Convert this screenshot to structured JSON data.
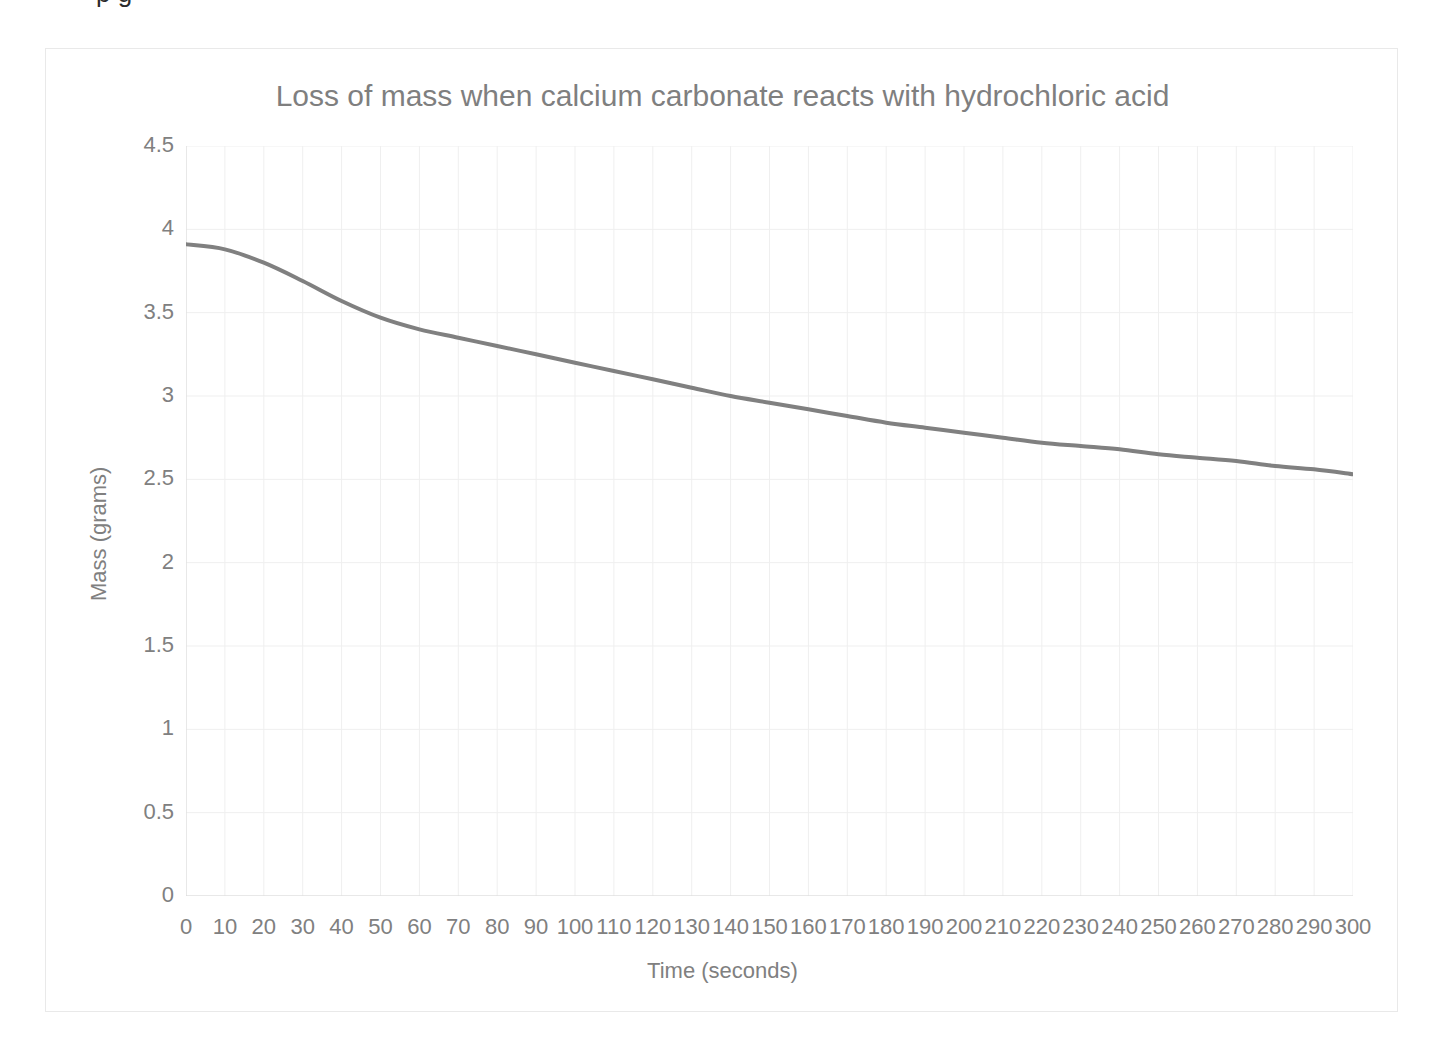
{
  "top_clipped_text": "p    g",
  "chart_frame": {
    "border_color": "#e9e9e9",
    "background": "#ffffff"
  },
  "chart_data": {
    "type": "line",
    "title": "Loss of mass when calcium carbonate reacts with hydrochloric acid",
    "xlabel": "Time (seconds)",
    "ylabel": "Mass (grams)",
    "xlim": [
      0,
      300
    ],
    "ylim": [
      0,
      4.5
    ],
    "grid": true,
    "legend": "none",
    "line_color": "#808080",
    "line_width": 4,
    "x_tick_labels": [
      "0",
      "10",
      "20",
      "30",
      "40",
      "50",
      "60",
      "70",
      "80",
      "90",
      "100",
      "110",
      "120",
      "130",
      "140",
      "150",
      "160",
      "170",
      "180",
      "190",
      "200",
      "210",
      "220",
      "230",
      "240",
      "250",
      "260",
      "270",
      "280",
      "290",
      "300"
    ],
    "y_tick_labels": [
      "0",
      "0.5",
      "1",
      "1.5",
      "2",
      "2.5",
      "3",
      "3.5",
      "4",
      "4.5"
    ],
    "x_tick_values": [
      0,
      10,
      20,
      30,
      40,
      50,
      60,
      70,
      80,
      90,
      100,
      110,
      120,
      130,
      140,
      150,
      160,
      170,
      180,
      190,
      200,
      210,
      220,
      230,
      240,
      250,
      260,
      270,
      280,
      290,
      300
    ],
    "y_tick_values": [
      0,
      0.5,
      1,
      1.5,
      2,
      2.5,
      3,
      3.5,
      4,
      4.5
    ],
    "series": [
      {
        "name": "Mass",
        "x": [
          0,
          10,
          20,
          30,
          40,
          50,
          60,
          70,
          80,
          90,
          100,
          110,
          120,
          130,
          140,
          150,
          160,
          170,
          180,
          190,
          200,
          210,
          220,
          230,
          240,
          250,
          260,
          270,
          280,
          290,
          300
        ],
        "values": [
          3.91,
          3.88,
          3.8,
          3.69,
          3.57,
          3.47,
          3.4,
          3.35,
          3.3,
          3.25,
          3.2,
          3.15,
          3.1,
          3.05,
          3.0,
          2.96,
          2.92,
          2.88,
          2.84,
          2.81,
          2.78,
          2.75,
          2.72,
          2.7,
          2.68,
          2.65,
          2.63,
          2.61,
          2.58,
          2.56,
          2.53
        ]
      }
    ]
  }
}
